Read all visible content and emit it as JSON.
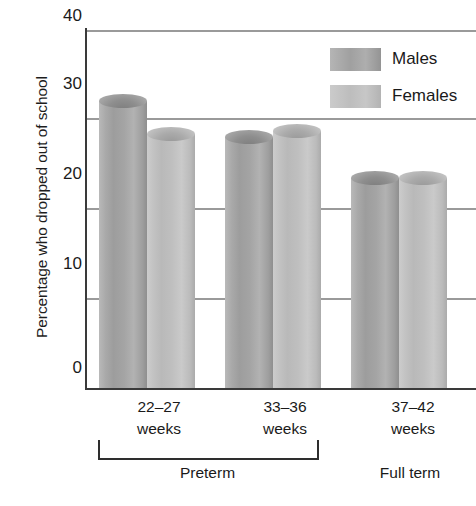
{
  "chart_data": {
    "type": "bar",
    "title": "",
    "xlabel": "",
    "ylabel": "Percentage who dropped out of school",
    "ylim": [
      0,
      40
    ],
    "yticks": [
      0,
      10,
      20,
      30,
      40
    ],
    "ytick_labels": [
      "0",
      "10",
      "20",
      "30",
      "40"
    ],
    "grid": true,
    "legend_position": "top-right",
    "categories": [
      "22–27 weeks",
      "33–36 weeks",
      "37–42 weeks"
    ],
    "series": [
      {
        "name": "Males",
        "values": [
          32.8,
          28.8,
          24.3
        ],
        "color": "#a3a3a3"
      },
      {
        "name": "Females",
        "values": [
          29.2,
          29.5,
          24.3
        ],
        "color": "#c2c2c2"
      }
    ],
    "annotations": [
      {
        "text": "Preterm",
        "spans": [
          "22–27 weeks",
          "33–36 weeks"
        ],
        "bracket": true
      },
      {
        "text": "Full term",
        "spans": [
          "37–42 weeks"
        ],
        "bracket": false
      }
    ]
  },
  "axis": {
    "y_title": "Percentage who dropped out of school",
    "ticks": [
      {
        "label": "40",
        "value": 40
      },
      {
        "label": "30",
        "value": 30
      },
      {
        "label": "20",
        "value": 20
      },
      {
        "label": "10",
        "value": 10
      },
      {
        "label": "0",
        "value": 0
      }
    ]
  },
  "legend": {
    "items": [
      {
        "label": "Males",
        "swatch": "male-swatch"
      },
      {
        "label": "Females",
        "swatch": "female-swatch"
      }
    ]
  },
  "x_axis": {
    "groups": [
      {
        "line1": "22–27",
        "line2": "weeks"
      },
      {
        "line1": "33–36",
        "line2": "weeks"
      },
      {
        "line1": "37–42",
        "line2": "weeks"
      }
    ]
  },
  "group_labels": {
    "preterm": "Preterm",
    "full_term": "Full term"
  },
  "bars": [
    {
      "group": "22–27 weeks",
      "series": "Males",
      "value": 32.8
    },
    {
      "group": "22–27 weeks",
      "series": "Females",
      "value": 29.2
    },
    {
      "group": "33–36 weeks",
      "series": "Males",
      "value": 28.8
    },
    {
      "group": "33–36 weeks",
      "series": "Females",
      "value": 29.5
    },
    {
      "group": "37–42 weeks",
      "series": "Males",
      "value": 24.3
    },
    {
      "group": "37–42 weeks",
      "series": "Females",
      "value": 24.3
    }
  ]
}
